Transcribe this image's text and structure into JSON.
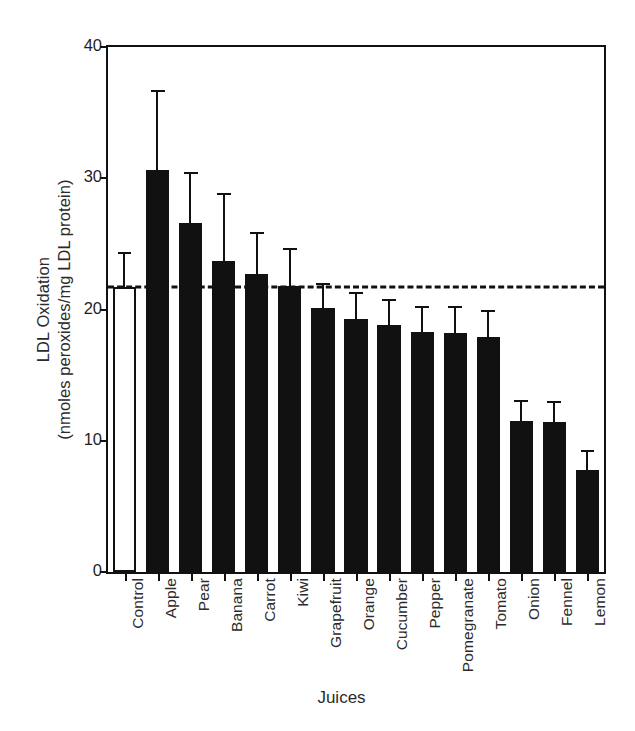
{
  "chart_data": {
    "type": "bar",
    "title": "",
    "xlabel": "Juices",
    "ylabel_line1": "LDL Oxidation",
    "ylabel_line2": "(nmoles peroxides/mg LDL protein)",
    "ylim": [
      0,
      40
    ],
    "yticks": [
      0,
      10,
      20,
      30,
      40
    ],
    "grid": false,
    "legend": "none",
    "reference_line": {
      "value": 21.7,
      "style": "dashed",
      "label": "control level"
    },
    "categories": [
      "Control",
      "Apple",
      "Pear",
      "Banana",
      "Carrot",
      "Kiwi",
      "Grapefruit",
      "Orange",
      "Cucumber",
      "Pepper",
      "Pomegranate",
      "Tomato",
      "Onion",
      "Fennel",
      "Lemon"
    ],
    "values": [
      21.7,
      30.6,
      26.6,
      23.7,
      22.7,
      21.8,
      20.1,
      19.3,
      18.8,
      18.3,
      18.2,
      17.9,
      11.5,
      11.4,
      7.8
    ],
    "errors": [
      2.7,
      6.1,
      3.9,
      5.2,
      3.2,
      2.9,
      1.9,
      2.0,
      2.0,
      2.0,
      2.1,
      2.1,
      1.6,
      1.6,
      1.5
    ],
    "bar_fill": "#111111",
    "control_fill": "#ffffff",
    "bar_edge": "#111111"
  }
}
